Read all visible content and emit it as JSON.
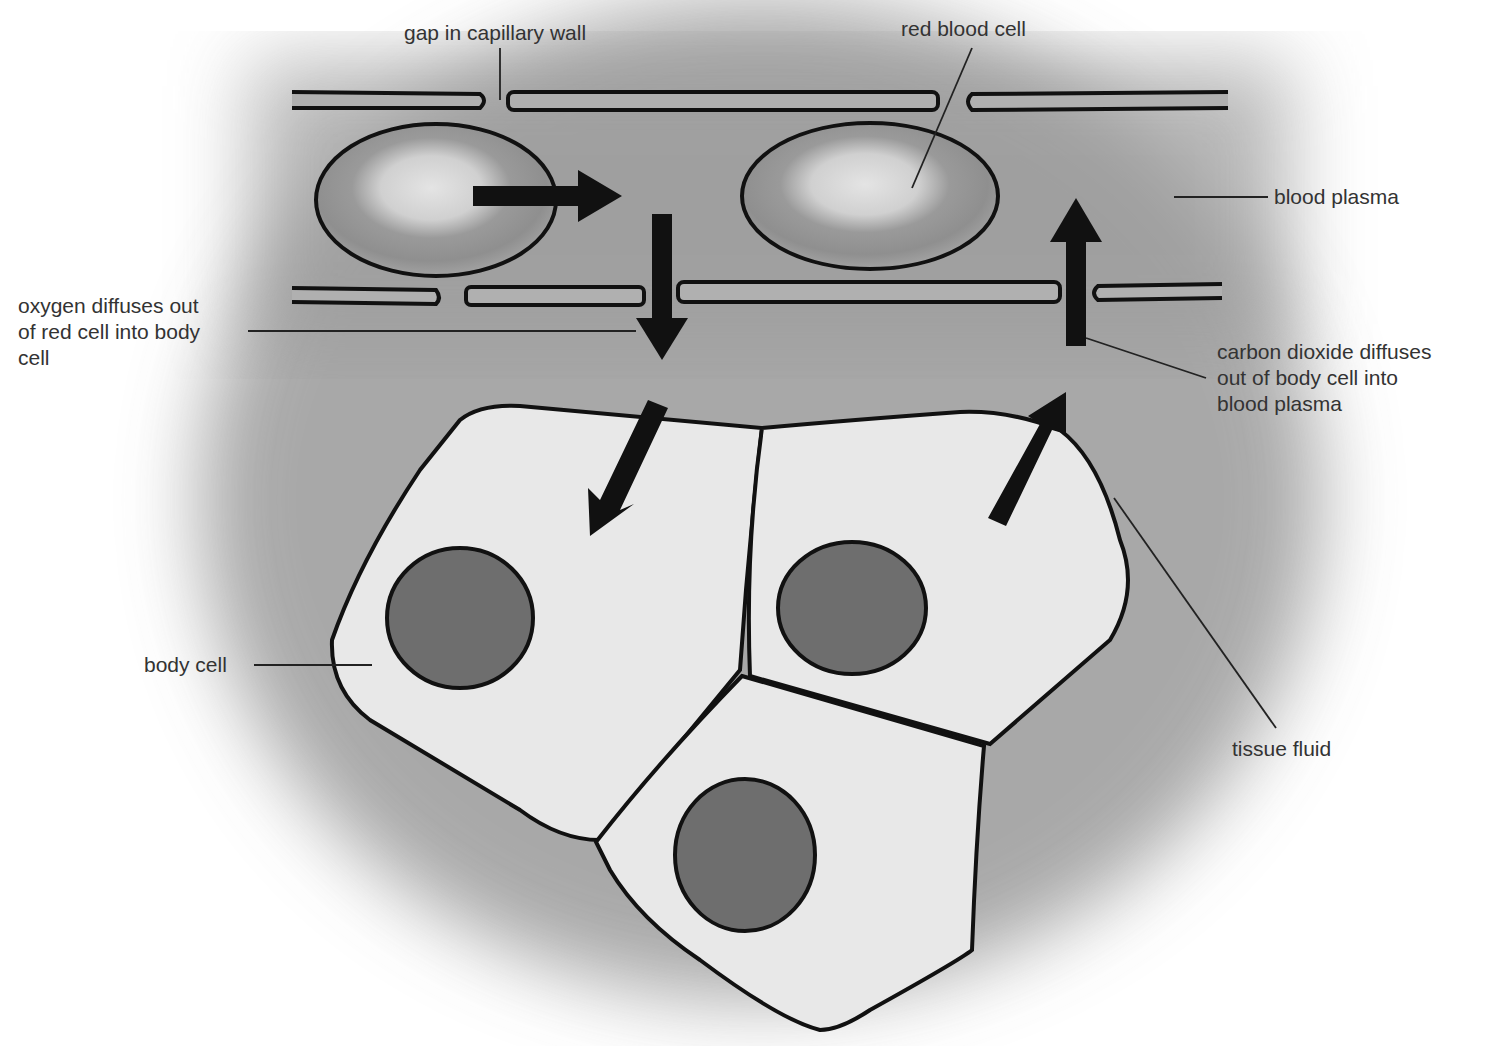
{
  "labels": {
    "gap": "gap in capillary wall",
    "rbc": "red blood cell",
    "plasma": "blood plasma",
    "oxygen": [
      "oxygen diffuses out",
      "of red cell into body",
      "cell"
    ],
    "co2": [
      "carbon dioxide diffuses",
      "out of body cell into",
      "blood plasma"
    ],
    "body_cell": "body cell",
    "tissue_fluid": "tissue fluid"
  },
  "colors": {
    "background": "#ffffff",
    "tissue_shadow": "#8a8a8a",
    "capillary": "#a8a8a8",
    "body_cell": "#e8e8e8",
    "nucleus": "#6e6e6e",
    "rbc_rim": "#8c8c8c",
    "rbc_center": "#d4d4d4",
    "outline": "#111111",
    "label": "#333333"
  }
}
